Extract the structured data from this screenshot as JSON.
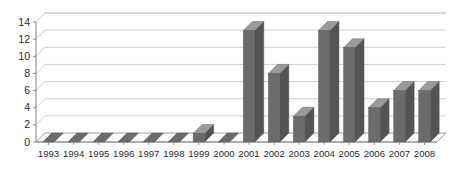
{
  "chart_data": {
    "type": "bar",
    "title": "",
    "subtitle": "",
    "xlabel": "",
    "ylabel": "",
    "categories": [
      "1993",
      "1994",
      "1995",
      "1996",
      "1997",
      "1998",
      "1999",
      "2000",
      "2001",
      "2002",
      "2003",
      "2004",
      "2005",
      "2006",
      "2007",
      "2008"
    ],
    "values": [
      0,
      0,
      0,
      0,
      0,
      0,
      1,
      0,
      13,
      8,
      3,
      13,
      11,
      4,
      6,
      6
    ],
    "series": [
      {
        "name": "Series 1",
        "values": [
          0,
          0,
          0,
          0,
          0,
          0,
          1,
          0,
          13,
          8,
          3,
          13,
          11,
          4,
          6,
          6
        ]
      }
    ],
    "ylim": [
      0,
      14
    ],
    "ytick_values": [
      0,
      2,
      4,
      6,
      8,
      10,
      12,
      14
    ],
    "ytick_labels": [
      "0",
      "2",
      "4",
      "6",
      "8",
      "10",
      "12",
      "14"
    ],
    "ytick_step": 2,
    "xtick_labels": [
      "1993",
      "1994",
      "1995",
      "1996",
      "1997",
      "1998",
      "1999",
      "2000",
      "2001",
      "2002",
      "2003",
      "2004",
      "2005",
      "2006",
      "2007",
      "2008"
    ],
    "grid": true,
    "grid_axis": "y",
    "legend": false,
    "legend_position": "none",
    "annotations": [],
    "style": "3d-column",
    "colors": {
      "bar_front": "#6b6b6b",
      "bar_top": "#9a9a9a",
      "bar_side": "#545454",
      "background": "#ffffff",
      "grid": "#c9c9c9",
      "axis": "#8c8c8c",
      "floor": "#fbfbfb",
      "text": "#2b2b2b"
    }
  }
}
